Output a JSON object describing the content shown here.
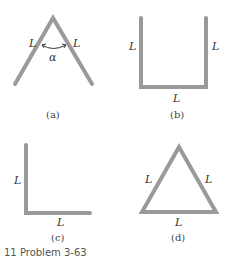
{
  "figure": {
    "panels": [
      {
        "id": "a",
        "caption": "(a)",
        "shape": "inverted-V",
        "labels": {
          "left": "L",
          "right": "L",
          "angle": "α"
        }
      },
      {
        "id": "b",
        "caption": "(b)",
        "shape": "U",
        "labels": {
          "left": "L",
          "right": "L",
          "bottom": "L"
        }
      },
      {
        "id": "c",
        "caption": "(c)",
        "shape": "L",
        "labels": {
          "left": "L",
          "bottom": "L"
        }
      },
      {
        "id": "d",
        "caption": "(d)",
        "shape": "triangle",
        "labels": {
          "left": "L",
          "right": "L",
          "bottom": "L"
        }
      }
    ],
    "footer_text": "11 Problem 3-63"
  },
  "colors": {
    "rod": "#9a9a9a",
    "text": "#333333",
    "background": "#ffffff"
  }
}
